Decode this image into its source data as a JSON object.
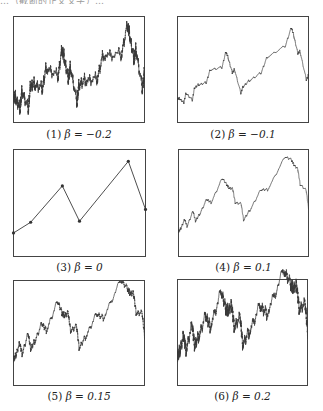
{
  "top_text": "…（截断的正文文字）…",
  "chart_data": [
    {
      "type": "line",
      "title": "(1) β = −0.2",
      "label_num": "(1)",
      "beta_text": "β = −0.2",
      "beta": -0.2,
      "xlabel": "",
      "ylabel": "",
      "grid": false,
      "interpolation_points": [
        [
          0,
          0.22
        ],
        [
          0.13,
          0.32
        ],
        [
          0.37,
          0.66
        ],
        [
          0.5,
          0.33
        ],
        [
          0.87,
          0.89
        ],
        [
          1.0,
          0.44
        ]
      ]
    },
    {
      "type": "line",
      "title": "(2) β = −0.1",
      "label_num": "(2)",
      "beta_text": "β = −0.1",
      "beta": -0.1,
      "xlabel": "",
      "ylabel": "",
      "grid": false,
      "interpolation_points": [
        [
          0,
          0.22
        ],
        [
          0.13,
          0.32
        ],
        [
          0.37,
          0.66
        ],
        [
          0.5,
          0.33
        ],
        [
          0.87,
          0.89
        ],
        [
          1.0,
          0.44
        ]
      ]
    },
    {
      "type": "line",
      "title": "(3) β = 0",
      "label_num": "(3)",
      "beta_text": "β = 0",
      "beta": 0,
      "xlabel": "",
      "ylabel": "",
      "grid": false,
      "markers": true,
      "interpolation_points": [
        [
          0,
          0.22
        ],
        [
          0.13,
          0.32
        ],
        [
          0.37,
          0.66
        ],
        [
          0.5,
          0.33
        ],
        [
          0.87,
          0.89
        ],
        [
          1.0,
          0.44
        ]
      ]
    },
    {
      "type": "line",
      "title": "(4) β = 0.1",
      "label_num": "(4)",
      "beta_text": "β = 0.1",
      "beta": 0.1,
      "xlabel": "",
      "ylabel": "",
      "grid": false,
      "interpolation_points": [
        [
          0,
          0.22
        ],
        [
          0.13,
          0.32
        ],
        [
          0.37,
          0.66
        ],
        [
          0.5,
          0.33
        ],
        [
          0.87,
          0.89
        ],
        [
          1.0,
          0.44
        ]
      ]
    },
    {
      "type": "line",
      "title": "(5) β = 0.15",
      "label_num": "(5)",
      "beta_text": "β = 0.15",
      "beta": 0.15,
      "xlabel": "",
      "ylabel": "",
      "grid": false,
      "interpolation_points": [
        [
          0,
          0.22
        ],
        [
          0.13,
          0.32
        ],
        [
          0.37,
          0.66
        ],
        [
          0.5,
          0.33
        ],
        [
          0.87,
          0.89
        ],
        [
          1.0,
          0.44
        ]
      ]
    },
    {
      "type": "line",
      "title": "(6) β = 0.2",
      "label_num": "(6)",
      "beta_text": "β = 0.2",
      "beta": 0.2,
      "xlabel": "",
      "ylabel": "",
      "grid": false,
      "interpolation_points": [
        [
          0,
          0.22
        ],
        [
          0.13,
          0.32
        ],
        [
          0.37,
          0.66
        ],
        [
          0.5,
          0.33
        ],
        [
          0.87,
          0.89
        ],
        [
          1.0,
          0.44
        ]
      ]
    }
  ],
  "layout": {
    "line_color": "#3a3a3a",
    "frame_color": "#444444",
    "panels": [
      {
        "x": 13,
        "y": 16,
        "w": 132,
        "h": 107,
        "cap_y": 128
      },
      {
        "x": 177,
        "y": 16,
        "w": 132,
        "h": 107,
        "cap_y": 128
      },
      {
        "x": 13,
        "y": 149,
        "w": 133,
        "h": 108,
        "cap_y": 261
      },
      {
        "x": 178,
        "y": 149,
        "w": 131,
        "h": 108,
        "cap_y": 261
      },
      {
        "x": 13,
        "y": 280,
        "w": 132,
        "h": 106,
        "cap_y": 390
      },
      {
        "x": 177,
        "y": 279,
        "w": 131,
        "h": 107,
        "cap_y": 390
      }
    ]
  }
}
